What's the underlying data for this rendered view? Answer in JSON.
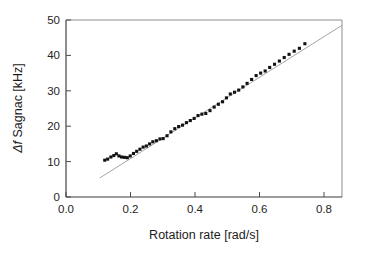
{
  "figure": {
    "background_color": "#ffffff",
    "marker_color": "#121212",
    "fit_line_color": "#9a9a9a",
    "axis_color": "#3a3a3a"
  },
  "chart_data": {
    "type": "scatter",
    "title": "",
    "xlabel_prefix": "Rotation rate",
    "xlabel_units": "[rad/s]",
    "xlabel": "Rotation rate [rad/s]",
    "ylabel_symbol": "Δf",
    "ylabel_rest": " Sagnac [kHz]",
    "ylabel": "Δf Sagnac [kHz]",
    "xlim": [
      0.0,
      0.855
    ],
    "ylim": [
      0,
      50
    ],
    "xticks": [
      0.0,
      0.2,
      0.4,
      0.6,
      0.8
    ],
    "xtick_labels": [
      "0.0",
      "0.2",
      "0.4",
      "0.6",
      "0.8"
    ],
    "yticks": [
      0,
      10,
      20,
      30,
      40,
      50
    ],
    "ytick_labels": [
      "0",
      "10",
      "20",
      "30",
      "40",
      "50"
    ],
    "grid": false,
    "legend": false,
    "series": [
      {
        "name": "Measured Sagnac frequency shift",
        "marker": "square",
        "marker_size": 3.1,
        "color": "#121212",
        "x": [
          0.12,
          0.129,
          0.139,
          0.148,
          0.156,
          0.164,
          0.172,
          0.181,
          0.19,
          0.199,
          0.209,
          0.219,
          0.229,
          0.239,
          0.249,
          0.259,
          0.269,
          0.28,
          0.291,
          0.301,
          0.313,
          0.325,
          0.337,
          0.349,
          0.361,
          0.373,
          0.385,
          0.397,
          0.409,
          0.421,
          0.433,
          0.446,
          0.459,
          0.472,
          0.485,
          0.497,
          0.509,
          0.522,
          0.535,
          0.548,
          0.561,
          0.575,
          0.589,
          0.603,
          0.617,
          0.631,
          0.646,
          0.661,
          0.676,
          0.691,
          0.707,
          0.723,
          0.74
        ],
        "y": [
          10.4,
          10.7,
          11.3,
          11.7,
          12.2,
          11.6,
          11.3,
          11.2,
          11.1,
          11.6,
          12.3,
          12.9,
          13.5,
          14.1,
          14.4,
          15.0,
          15.6,
          15.9,
          16.4,
          16.5,
          17.3,
          18.4,
          19.3,
          19.9,
          20.3,
          21.0,
          21.6,
          22.2,
          23.0,
          23.4,
          23.6,
          24.4,
          25.4,
          26.2,
          26.9,
          28.0,
          29.1,
          29.6,
          30.2,
          31.1,
          32.1,
          33.2,
          34.3,
          35.0,
          35.6,
          36.6,
          37.5,
          38.4,
          39.4,
          40.3,
          41.2,
          42.0,
          43.3
        ]
      }
    ],
    "fit": {
      "name": "Linear fit (ideal Sagnac response)",
      "type": "line",
      "color": "#9a9a9a",
      "x_start": 0.105,
      "y_start": 5.4,
      "x_end": 0.855,
      "y_end": 48.5,
      "slope": 57.5,
      "intercept": -0.64
    },
    "annotations": [
      {
        "text": "Lock-in plateau near 10-11 kHz below 0.2 rad/s",
        "visible": false
      }
    ]
  }
}
